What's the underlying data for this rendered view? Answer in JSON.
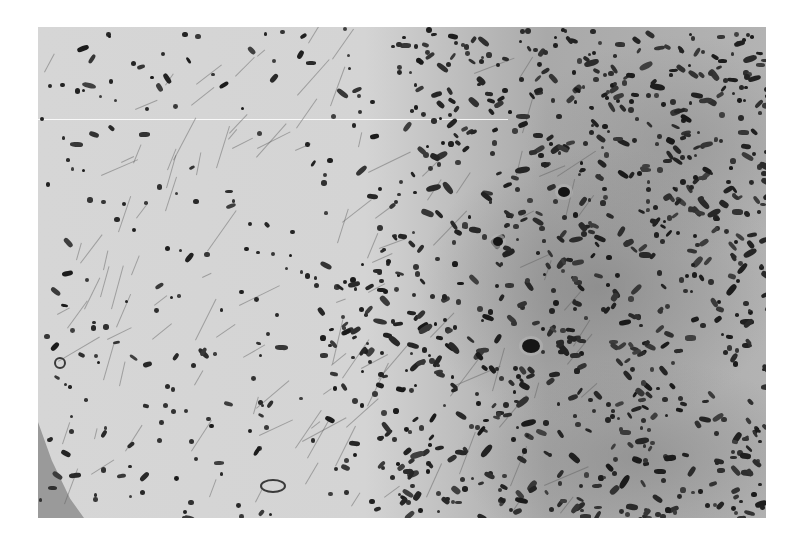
{
  "image": {
    "type": "histology-micrograph",
    "stain_appearance": "grayscale (H&E-like)",
    "background_color": "#ffffff",
    "frame": {
      "left": 38,
      "top": 27,
      "width": 728,
      "height": 491
    },
    "regions": {
      "left_tissue_tone": "#d5d5d5",
      "right_tissue_tone": "#ababab",
      "fold_tone": "#9a9a9a",
      "nucleus_color": "#2a2a2a",
      "giant_cell_color": "#151515"
    },
    "features": {
      "scratch_line": {
        "y": 92,
        "length": 470
      },
      "giant_cells": [
        {
          "x": 484,
          "y": 312,
          "w": 18,
          "h": 14
        },
        {
          "x": 520,
          "y": 160,
          "w": 12,
          "h": 10
        },
        {
          "x": 455,
          "y": 210,
          "w": 10,
          "h": 9
        }
      ],
      "vessels": [
        {
          "x": 222,
          "y": 452,
          "w": 22,
          "h": 10
        },
        {
          "x": 16,
          "y": 330,
          "w": 8,
          "h": 8
        }
      ]
    },
    "nuclei_generation": {
      "seed": 1337,
      "sparse_count": 260,
      "dense_count": 900,
      "transition_x": 400
    }
  }
}
